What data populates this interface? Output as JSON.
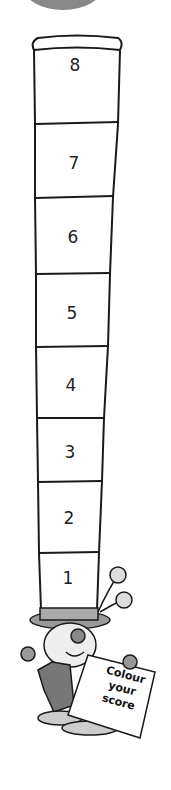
{
  "score_column": {
    "cells": [
      {
        "label": "8",
        "y": 65
      },
      {
        "label": "7",
        "y": 163
      },
      {
        "label": "6",
        "y": 237
      },
      {
        "label": "5",
        "y": 313
      },
      {
        "label": "4",
        "y": 385
      },
      {
        "label": "3",
        "y": 452
      },
      {
        "label": "2",
        "y": 520
      },
      {
        "label": "1",
        "y": 580
      }
    ]
  },
  "mascot": {
    "sign_lines": [
      "Colour",
      "your",
      "score"
    ]
  },
  "colors": {
    "line": "#1a1a1a",
    "blob": "#888888"
  }
}
